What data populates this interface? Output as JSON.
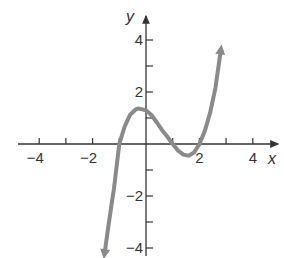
{
  "chart_data": {
    "type": "line",
    "title": "",
    "xlabel": "x",
    "ylabel": "y",
    "xlim": [
      -4.5,
      5
    ],
    "ylim": [
      -4.5,
      4.8
    ],
    "x_ticks": [
      -4,
      -3,
      -2,
      -1,
      1,
      2,
      3,
      4
    ],
    "x_tick_labels": [
      "-4",
      "-2",
      "2",
      "4"
    ],
    "y_ticks": [
      -4,
      -3,
      -2,
      -1,
      1,
      2,
      3,
      4
    ],
    "y_tick_labels": [
      "4",
      "2",
      "-2",
      "-4"
    ],
    "grid": false,
    "series": [
      {
        "name": "f(x)",
        "description": "cubic with zeros at x = -1, 1, 2; arrows at both ends",
        "color": "#8a8a8a",
        "x": [
          -1.55,
          -1.4,
          -1.2,
          -1.0,
          -0.8,
          -0.6,
          -0.4,
          -0.3,
          -0.2,
          0,
          0.2,
          0.4,
          0.6,
          0.8,
          1.0,
          1.2,
          1.4,
          1.6,
          1.8,
          2.0,
          2.2,
          2.4,
          2.6,
          2.8
        ],
        "y": [
          -4.2,
          -3.1,
          -1.7,
          0,
          0.67,
          1.12,
          1.32,
          1.36,
          1.35,
          1.3,
          1.12,
          0.84,
          0.54,
          0.28,
          0,
          -0.25,
          -0.41,
          -0.45,
          -0.33,
          0,
          0.49,
          1.2,
          2.15,
          3.6
        ]
      }
    ]
  }
}
